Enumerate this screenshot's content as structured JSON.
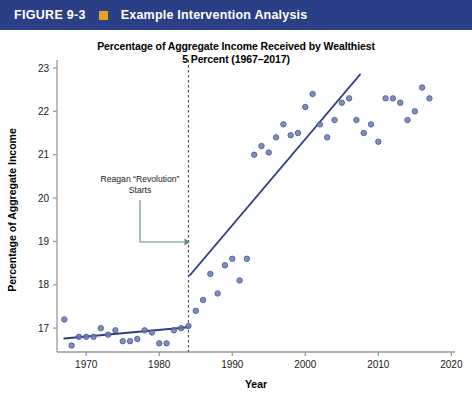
{
  "banner": {
    "figure_number": "FIGURE 9-3",
    "title": "Example Intervention Analysis",
    "bar_color": "#2b3f87",
    "square_color": "#e8a31e",
    "square_icon": "orange-square-icon"
  },
  "chart_data": {
    "type": "scatter",
    "title": "Percentage of Aggregate Income Received by Wealthiest 5 Percent (1967–2017)",
    "title_line1": "Percentage of Aggregate Income Received by Wealthiest",
    "title_line2": "5 Percent (1967–2017)",
    "xlabel": "Year",
    "ylabel": "Percentage of Aggregate Income",
    "xlim": [
      1966,
      2020.5
    ],
    "ylim": [
      16.45,
      23
    ],
    "xticks": [
      1970,
      1980,
      1990,
      2000,
      2010,
      2020
    ],
    "yticks": [
      17,
      18,
      19,
      20,
      21,
      22,
      23
    ],
    "grid": false,
    "legend": null,
    "marker_color": "#6b7bb5",
    "marker_edge_color": "#4a5a95",
    "trend_color": "#2e3f7f",
    "points": [
      {
        "x": 1967,
        "y": 17.2
      },
      {
        "x": 1968,
        "y": 16.6
      },
      {
        "x": 1969,
        "y": 16.8
      },
      {
        "x": 1970,
        "y": 16.8
      },
      {
        "x": 1971,
        "y": 16.8
      },
      {
        "x": 1972,
        "y": 17.0
      },
      {
        "x": 1973,
        "y": 16.85
      },
      {
        "x": 1974,
        "y": 16.95
      },
      {
        "x": 1975,
        "y": 16.7
      },
      {
        "x": 1976,
        "y": 16.7
      },
      {
        "x": 1977,
        "y": 16.75
      },
      {
        "x": 1978,
        "y": 16.95
      },
      {
        "x": 1979,
        "y": 16.9
      },
      {
        "x": 1980,
        "y": 16.65
      },
      {
        "x": 1981,
        "y": 16.65
      },
      {
        "x": 1982,
        "y": 16.95
      },
      {
        "x": 1983,
        "y": 17.0
      },
      {
        "x": 1984,
        "y": 17.05
      },
      {
        "x": 1985,
        "y": 17.4
      },
      {
        "x": 1986,
        "y": 17.65
      },
      {
        "x": 1987,
        "y": 18.25
      },
      {
        "x": 1988,
        "y": 17.8
      },
      {
        "x": 1989,
        "y": 18.45
      },
      {
        "x": 1990,
        "y": 18.6
      },
      {
        "x": 1991,
        "y": 18.1
      },
      {
        "x": 1992,
        "y": 18.6
      },
      {
        "x": 1993,
        "y": 21.0
      },
      {
        "x": 1994,
        "y": 21.2
      },
      {
        "x": 1995,
        "y": 21.05
      },
      {
        "x": 1996,
        "y": 21.4
      },
      {
        "x": 1997,
        "y": 21.7
      },
      {
        "x": 1998,
        "y": 21.45
      },
      {
        "x": 1999,
        "y": 21.5
      },
      {
        "x": 2000,
        "y": 22.1
      },
      {
        "x": 2001,
        "y": 22.4
      },
      {
        "x": 2002,
        "y": 21.7
      },
      {
        "x": 2003,
        "y": 21.4
      },
      {
        "x": 2004,
        "y": 21.8
      },
      {
        "x": 2005,
        "y": 22.2
      },
      {
        "x": 2006,
        "y": 22.3
      },
      {
        "x": 2007,
        "y": 21.8
      },
      {
        "x": 2008,
        "y": 21.5
      },
      {
        "x": 2009,
        "y": 21.7
      },
      {
        "x": 2010,
        "y": 21.3
      },
      {
        "x": 2011,
        "y": 22.3
      },
      {
        "x": 2012,
        "y": 22.3
      },
      {
        "x": 2013,
        "y": 22.2
      },
      {
        "x": 2014,
        "y": 21.8
      },
      {
        "x": 2015,
        "y": 22.0
      },
      {
        "x": 2016,
        "y": 22.55
      },
      {
        "x": 2017,
        "y": 22.3
      }
    ],
    "trend_lines": [
      {
        "name": "pre-intervention",
        "x0": 1967,
        "y0": 16.76,
        "x1": 1984,
        "y1": 17.02
      },
      {
        "name": "post-intervention",
        "x0": 1984.2,
        "y0": 18.22,
        "x1": 2007.5,
        "y1": 22.85
      }
    ],
    "intervention": {
      "x": 1984,
      "line_style": "dashed",
      "color": "#4a4a4a"
    },
    "annotation": {
      "line1": "Reagan “Revolution”",
      "line2": "Starts",
      "arrow_color": "#5f8a8a"
    }
  }
}
